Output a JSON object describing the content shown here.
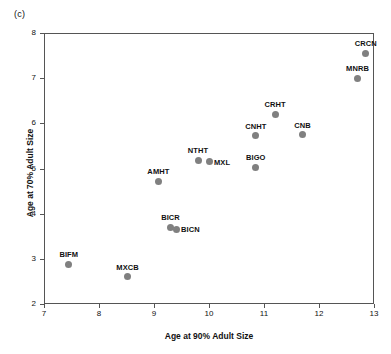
{
  "figure": {
    "panel_label": "(c)",
    "background_color": "#ffffff",
    "marker_color": "#808080",
    "axis_color": "#555555"
  },
  "chart_data": {
    "type": "scatter",
    "title": "",
    "panel": "(c)",
    "xlabel": "Age at 90% Adult Size",
    "ylabel": "Age at 70% Adult Size",
    "xlim": [
      7,
      13
    ],
    "ylim": [
      2,
      8
    ],
    "xticks": [
      7,
      8,
      9,
      10,
      11,
      12,
      13
    ],
    "yticks": [
      2,
      3,
      4,
      5,
      6,
      7,
      8
    ],
    "xtick_labels": [
      "7",
      "8",
      "9",
      "10",
      "11",
      "12",
      "13"
    ],
    "ytick_labels": [
      "2",
      "3",
      "4",
      "5",
      "6",
      "7",
      "8"
    ],
    "grid": false,
    "legend": null,
    "marker_color": "#808080",
    "points": [
      {
        "label": "CRCN",
        "x": 12.85,
        "y": 7.55,
        "label_pos": "above"
      },
      {
        "label": "MNRB",
        "x": 12.7,
        "y": 7.0,
        "label_pos": "above"
      },
      {
        "label": "CRHT",
        "x": 11.2,
        "y": 6.2,
        "label_pos": "above"
      },
      {
        "label": "CNB",
        "x": 11.7,
        "y": 5.75,
        "label_pos": "above"
      },
      {
        "label": "CNHT",
        "x": 10.85,
        "y": 5.73,
        "label_pos": "above"
      },
      {
        "label": "NTHT",
        "x": 9.8,
        "y": 5.18,
        "label_pos": "above"
      },
      {
        "label": "MXL",
        "x": 10.0,
        "y": 5.15,
        "label_pos": "right"
      },
      {
        "label": "BIGO",
        "x": 10.85,
        "y": 5.03,
        "label_pos": "above"
      },
      {
        "label": "AMHT",
        "x": 9.08,
        "y": 4.72,
        "label_pos": "above"
      },
      {
        "label": "BICR",
        "x": 9.3,
        "y": 3.7,
        "label_pos": "above"
      },
      {
        "label": "BICN",
        "x": 9.4,
        "y": 3.65,
        "label_pos": "right"
      },
      {
        "label": "BIFM",
        "x": 7.45,
        "y": 2.88,
        "label_pos": "above"
      },
      {
        "label": "MXCB",
        "x": 8.52,
        "y": 2.6,
        "label_pos": "above"
      }
    ]
  }
}
